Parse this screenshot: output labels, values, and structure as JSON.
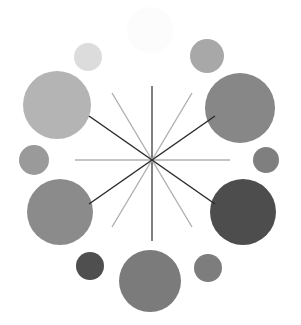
{
  "figure": {
    "width": 301,
    "height": 325,
    "background_color": "#ffffff"
  },
  "chart_data": {
    "type": "scatter",
    "title": "",
    "subtitle": "",
    "xlabel": "",
    "ylabel": "",
    "xlim": [
      0,
      301
    ],
    "ylim": [
      0,
      325
    ],
    "grid": false,
    "legend": "none",
    "axis_visible": false,
    "tick_labels": [],
    "annotations": [],
    "center": {
      "x": 152,
      "y": 160
    },
    "series": [
      {
        "name": "ring-bubbles",
        "marker": "circle",
        "points": [
          {
            "id": "bubble-top",
            "label": "top",
            "x": 150,
            "y": 30,
            "r": 23,
            "color": "#fcfcfc",
            "angle_deg": 90
          },
          {
            "id": "bubble-top-right",
            "label": "top-right",
            "x": 207,
            "y": 56,
            "r": 17,
            "color": "#a8a8a8",
            "angle_deg": 60
          },
          {
            "id": "bubble-right-upper",
            "label": "right-upper",
            "x": 240,
            "y": 108,
            "r": 35,
            "color": "#878787",
            "angle_deg": 30
          },
          {
            "id": "bubble-right",
            "label": "right",
            "x": 266,
            "y": 160,
            "r": 13,
            "color": "#7f7f7f",
            "angle_deg": 0
          },
          {
            "id": "bubble-right-lower",
            "label": "right-lower",
            "x": 243,
            "y": 212,
            "r": 33,
            "color": "#4d4d4d",
            "angle_deg": -30
          },
          {
            "id": "bubble-bottom-right",
            "label": "bottom-right",
            "x": 208,
            "y": 268,
            "r": 14,
            "color": "#7d7d7d",
            "angle_deg": -60
          },
          {
            "id": "bubble-bottom",
            "label": "bottom",
            "x": 150,
            "y": 281,
            "r": 31,
            "color": "#7b7b7b",
            "angle_deg": -90
          },
          {
            "id": "bubble-bottom-left",
            "label": "bottom-left",
            "x": 90,
            "y": 266,
            "r": 14,
            "color": "#4f4f4f",
            "angle_deg": -120
          },
          {
            "id": "bubble-left-lower",
            "label": "left-lower",
            "x": 60,
            "y": 212,
            "r": 33,
            "color": "#8b8b8b",
            "angle_deg": -150
          },
          {
            "id": "bubble-left",
            "label": "left",
            "x": 34,
            "y": 160,
            "r": 15,
            "color": "#9a9a9a",
            "angle_deg": 180
          },
          {
            "id": "bubble-left-upper",
            "label": "left-upper",
            "x": 57,
            "y": 105,
            "r": 34,
            "color": "#b4b4b4",
            "angle_deg": 150
          },
          {
            "id": "bubble-top-left",
            "label": "top-left",
            "x": 88,
            "y": 57,
            "r": 14,
            "color": "#dcdcdc",
            "angle_deg": 120
          }
        ]
      },
      {
        "name": "center-spokes",
        "marker": "line",
        "lines": [
          {
            "id": "spoke-vertical",
            "label": "vertical",
            "x1": 152,
            "y1": 86,
            "x2": 152,
            "y2": 241,
            "color": "#4a4a4a",
            "width": 1.4
          },
          {
            "id": "spoke-horizontal",
            "label": "horizontal",
            "x1": 75,
            "y1": 160,
            "x2": 230,
            "y2": 160,
            "color": "#b0b0b0",
            "width": 1.4
          },
          {
            "id": "spoke-diag-nw-se-steep",
            "label": "diagonal-steep-nw",
            "x1": 112,
            "y1": 93,
            "x2": 192,
            "y2": 227,
            "color": "#b0b0b0",
            "width": 1.4
          },
          {
            "id": "spoke-diag-ne-sw-steep",
            "label": "diagonal-steep-ne",
            "x1": 192,
            "y1": 93,
            "x2": 112,
            "y2": 227,
            "color": "#b0b0b0",
            "width": 1.4
          },
          {
            "id": "spoke-diag-nw-se-shallow",
            "label": "diagonal-shallow-nw",
            "x1": 89,
            "y1": 116,
            "x2": 215,
            "y2": 204,
            "color": "#2b2b2b",
            "width": 1.5
          },
          {
            "id": "spoke-diag-ne-sw-shallow",
            "label": "diagonal-shallow-ne",
            "x1": 215,
            "y1": 116,
            "x2": 89,
            "y2": 204,
            "color": "#2b2b2b",
            "width": 1.5
          }
        ]
      }
    ]
  }
}
